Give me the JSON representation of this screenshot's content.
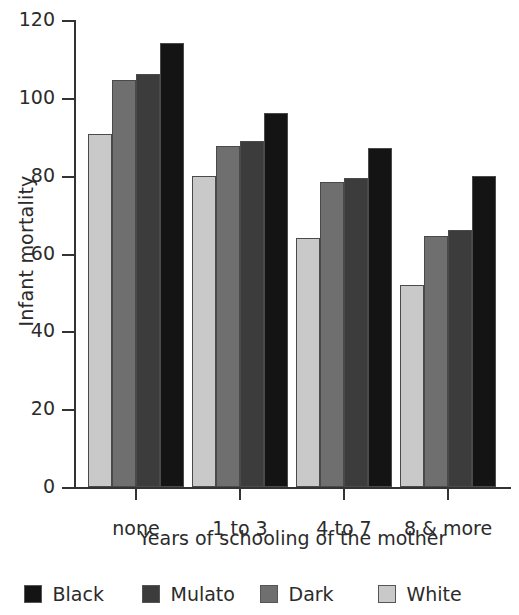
{
  "chart_data": {
    "type": "bar",
    "title": "",
    "xlabel": "Years of schooling of the mother",
    "ylabel": "Infant mortality",
    "categories": [
      "none",
      "1 to 3",
      "4 to 7",
      "8 & more"
    ],
    "ylim": [
      0,
      120
    ],
    "yticks": [
      0,
      20,
      40,
      60,
      80,
      100,
      120
    ],
    "ytick_labels": [
      "0",
      "20",
      "40",
      "60",
      "80",
      "100",
      "120"
    ],
    "grid": false,
    "legend_position": "bottom",
    "bar_draw_order": [
      "White",
      "Dark",
      "Mulato",
      "Black"
    ],
    "series": [
      {
        "name": "Black",
        "color": "#141414",
        "values": [
          114,
          96,
          87,
          80
        ]
      },
      {
        "name": "Mulato",
        "color": "#3c3c3c",
        "values": [
          106,
          89,
          79.5,
          66
        ]
      },
      {
        "name": "Dark",
        "color": "#6f6f6f",
        "values": [
          104.5,
          87.5,
          78.5,
          64.5
        ]
      },
      {
        "name": "White",
        "color": "#c9c9c9",
        "values": [
          90.7,
          80,
          64,
          52
        ]
      }
    ]
  },
  "legend": {
    "items": [
      {
        "label": "Black",
        "color": "#141414"
      },
      {
        "label": "Mulato",
        "color": "#3c3c3c"
      },
      {
        "label": "Dark",
        "color": "#6f6f6f"
      },
      {
        "label": "White",
        "color": "#c9c9c9"
      }
    ]
  }
}
